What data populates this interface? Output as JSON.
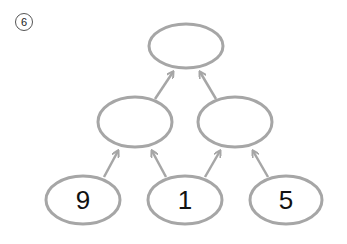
{
  "problem_number": "6",
  "colors": {
    "stroke": "#a6a6a6",
    "text": "#111111"
  },
  "nodes": {
    "top": {
      "value": ""
    },
    "mid_left": {
      "value": ""
    },
    "mid_right": {
      "value": ""
    },
    "bottom_left": {
      "value": "9"
    },
    "bottom_middle": {
      "value": "1"
    },
    "bottom_right": {
      "value": "5"
    }
  }
}
